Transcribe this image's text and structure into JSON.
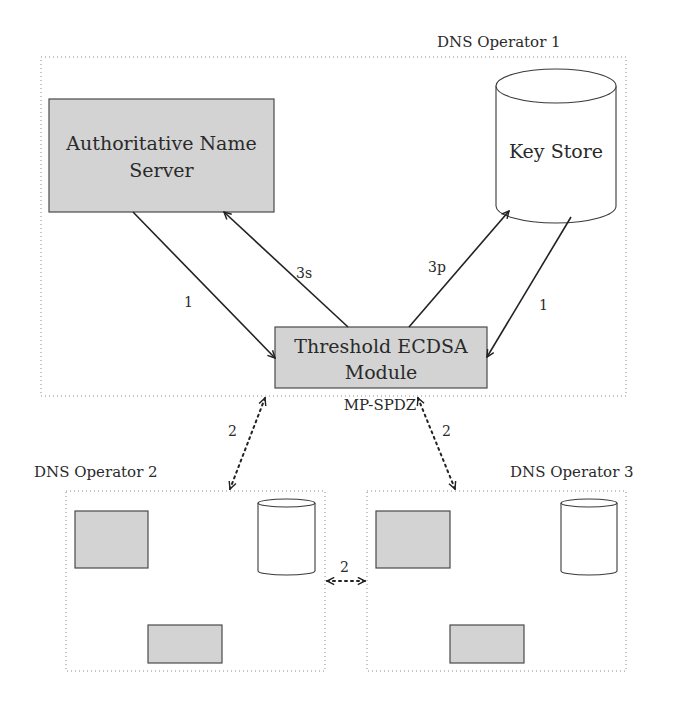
{
  "operators": [
    {
      "id": "op1",
      "label": "DNS Operator 1",
      "label_pos": [
        437,
        47
      ],
      "rect": [
        41,
        57,
        585,
        339
      ],
      "components": {
        "name_server": {
          "label_line1": "Authoritative Name",
          "label_line2": "Server",
          "rect": [
            49,
            99,
            225,
            113
          ]
        },
        "key_store": {
          "label": "Key Store",
          "x": 496,
          "w": 120,
          "top": 86,
          "bottom": 206,
          "ry": 17
        },
        "threshold_module": {
          "label_line1": "Threshold ECDSA",
          "label_line2": "Module",
          "rect": [
            275,
            327,
            212,
            61
          ],
          "sublabel": "MP-SPDZ"
        }
      }
    },
    {
      "id": "op2",
      "label": "DNS Operator 2",
      "label_pos": [
        34,
        477
      ],
      "rect": [
        66,
        491,
        259,
        180
      ],
      "components": {
        "name_server": {
          "rect": [
            75,
            511,
            73,
            57
          ]
        },
        "key_store": {
          "x": 258,
          "w": 57,
          "top": 503,
          "bottom": 571,
          "ry": 4
        },
        "threshold_module": {
          "rect": [
            148,
            625,
            74,
            38
          ]
        }
      }
    },
    {
      "id": "op3",
      "label": "DNS Operator 3",
      "label_pos": [
        510,
        477
      ],
      "rect": [
        367,
        491,
        259,
        180
      ],
      "components": {
        "name_server": {
          "rect": [
            376,
            511,
            74,
            57
          ]
        },
        "key_store": {
          "x": 561,
          "w": 56,
          "top": 503,
          "bottom": 571,
          "ry": 4
        },
        "threshold_module": {
          "rect": [
            450,
            625,
            74,
            38
          ]
        }
      }
    }
  ],
  "edges": [
    {
      "id": "ans-to-threshold",
      "label": "1",
      "style": "solid",
      "from": [
        133,
        212
      ],
      "to": [
        275,
        358
      ],
      "label_pos": [
        184,
        307
      ]
    },
    {
      "id": "threshold-to-ans",
      "label": "3s",
      "style": "solid",
      "from": [
        348,
        327
      ],
      "to": [
        224,
        212
      ],
      "label_pos": [
        296,
        278
      ]
    },
    {
      "id": "threshold-to-keystore",
      "label": "3p",
      "style": "solid",
      "from": [
        409,
        327
      ],
      "to": [
        509,
        211
      ],
      "label_pos": [
        428,
        272
      ]
    },
    {
      "id": "keystore-to-threshold",
      "label": "1",
      "style": "solid",
      "from": [
        571,
        217
      ],
      "to": [
        487,
        357
      ],
      "label_pos": [
        539,
        310
      ]
    },
    {
      "id": "op1-op2-mpc",
      "label": "2",
      "style": "dotted",
      "from": [
        265,
        398
      ],
      "to": [
        230,
        489
      ],
      "label_pos": [
        228,
        436
      ],
      "bidirectional": true
    },
    {
      "id": "op1-op3-mpc",
      "label": "2",
      "style": "dotted",
      "from": [
        418,
        398
      ],
      "to": [
        455,
        489
      ],
      "label_pos": [
        442,
        436
      ],
      "bidirectional": true
    },
    {
      "id": "op2-op3-mpc",
      "label": "2",
      "style": "dotted",
      "from": [
        327,
        581
      ],
      "to": [
        365,
        581
      ],
      "label_pos": [
        340,
        572
      ],
      "bidirectional": true
    }
  ],
  "colors": {
    "component_fill": "#d3d3d3",
    "component_stroke": "#4a4a4a",
    "text": "#2a2a2a",
    "border": "#8a8a8a"
  }
}
